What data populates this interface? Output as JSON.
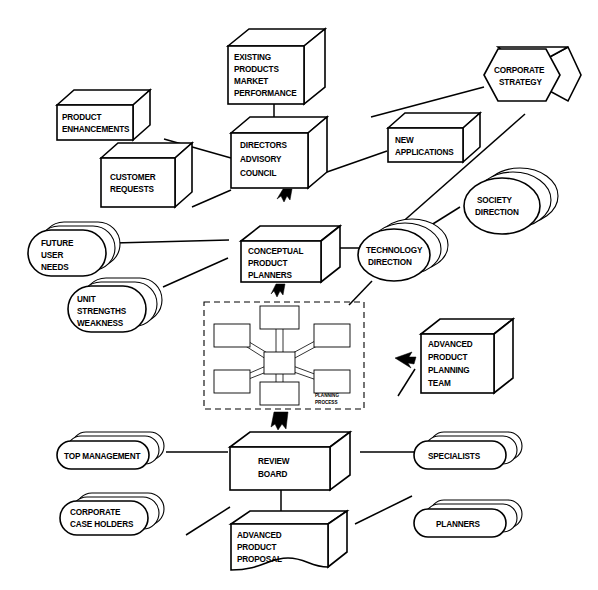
{
  "diagram": {
    "style": {
      "line_color": "#000000",
      "fill_color": "#ffffff",
      "background": "#ffffff"
    },
    "nodes": {
      "existing_products": "EXISTING\nPRODUCTS\nMARKET\nPERFORMANCE",
      "existing_products_lines": [
        "EXISTING",
        "PRODUCTS",
        "MARKET",
        "PERFORMANCE"
      ],
      "product_enhancements_lines": [
        "PRODUCT",
        "ENHANCEMENTS"
      ],
      "customer_requests_lines": [
        "CUSTOMER",
        "REQUESTS"
      ],
      "directors_advisory_council_lines": [
        "DIRECTORS",
        "ADVISORY",
        "COUNCIL"
      ],
      "corporate_strategy_lines": [
        "CORPORATE",
        "STRATEGY"
      ],
      "new_applications_lines": [
        "NEW",
        "APPLICATIONS"
      ],
      "society_direction_lines": [
        "SOCIETY",
        "DIRECTION"
      ],
      "future_user_needs_lines": [
        "FUTURE",
        "USER",
        "NEEDS"
      ],
      "unit_strengths_weakness_lines": [
        "UNIT",
        "STRENGTHS",
        "WEAKNESS"
      ],
      "conceptual_product_planners_lines": [
        "CONCEPTUAL",
        "PRODUCT",
        "PLANNERS"
      ],
      "technology_direction_lines": [
        "TECHNOLOGY",
        "DIRECTION"
      ],
      "planning_process_lines": [
        "PLANNING",
        "PROCESS"
      ],
      "advanced_product_planning_team_lines": [
        "ADVANCED",
        "PRODUCT",
        "PLANNING",
        "TEAM"
      ],
      "top_management_lines": [
        "TOP MANAGEMENT"
      ],
      "corporate_case_holders_lines": [
        "CORPORATE",
        "CASE HOLDERS"
      ],
      "review_board_lines": [
        "REVIEW",
        "BOARD"
      ],
      "specialists_lines": [
        "SPECIALISTS"
      ],
      "planners_lines": [
        "PLANNERS"
      ],
      "advanced_product_proposal_lines": [
        "ADVANCED",
        "PRODUCT",
        "PROPOSAL"
      ]
    },
    "node_list": [
      {
        "id": "existing-products-market-performance",
        "label": "EXISTING PRODUCTS MARKET PERFORMANCE",
        "shape": "3d-box"
      },
      {
        "id": "product-enhancements",
        "label": "PRODUCT ENHANCEMENTS",
        "shape": "3d-box"
      },
      {
        "id": "customer-requests",
        "label": "CUSTOMER REQUESTS",
        "shape": "3d-box"
      },
      {
        "id": "directors-advisory-council",
        "label": "DIRECTORS ADVISORY COUNCIL",
        "shape": "3d-cube"
      },
      {
        "id": "corporate-strategy",
        "label": "CORPORATE STRATEGY",
        "shape": "3d-hexagon"
      },
      {
        "id": "new-applications",
        "label": "NEW APPLICATIONS",
        "shape": "3d-box"
      },
      {
        "id": "society-direction",
        "label": "SOCIETY DIRECTION",
        "shape": "stacked-oval"
      },
      {
        "id": "future-user-needs",
        "label": "FUTURE USER NEEDS",
        "shape": "stacked-oval"
      },
      {
        "id": "unit-strengths-weakness",
        "label": "UNIT STRENGTHS WEAKNESS",
        "shape": "stacked-oval"
      },
      {
        "id": "conceptual-product-planners",
        "label": "CONCEPTUAL PRODUCT PLANNERS",
        "shape": "3d-box"
      },
      {
        "id": "technology-direction",
        "label": "TECHNOLOGY DIRECTION",
        "shape": "stacked-oval"
      },
      {
        "id": "planning-process",
        "label": "PLANNING PROCESS",
        "shape": "dashed-container"
      },
      {
        "id": "advanced-product-planning-team",
        "label": "ADVANCED PRODUCT PLANNING TEAM",
        "shape": "3d-cube"
      },
      {
        "id": "top-management",
        "label": "TOP MANAGEMENT",
        "shape": "stacked-lozenge"
      },
      {
        "id": "corporate-case-holders",
        "label": "CORPORATE CASE HOLDERS",
        "shape": "stacked-lozenge"
      },
      {
        "id": "review-board",
        "label": "REVIEW BOARD",
        "shape": "3d-box"
      },
      {
        "id": "specialists",
        "label": "SPECIALISTS",
        "shape": "stacked-lozenge"
      },
      {
        "id": "planners",
        "label": "PLANNERS",
        "shape": "stacked-lozenge"
      },
      {
        "id": "advanced-product-proposal",
        "label": "ADVANCED PRODUCT PROPOSAL",
        "shape": "3d-document"
      }
    ],
    "connections": [
      {
        "from": "existing-products-market-performance",
        "to": "directors-advisory-council",
        "type": "line"
      },
      {
        "from": "product-enhancements",
        "to": "directors-advisory-council",
        "type": "line"
      },
      {
        "from": "customer-requests",
        "to": "directors-advisory-council",
        "type": "line"
      },
      {
        "from": "corporate-strategy",
        "to": "directors-advisory-council",
        "type": "line"
      },
      {
        "from": "new-applications",
        "to": "directors-advisory-council",
        "type": "line"
      },
      {
        "from": "directors-advisory-council",
        "to": "conceptual-product-planners",
        "type": "arrow-down"
      },
      {
        "from": "society-direction",
        "to": "conceptual-product-planners",
        "type": "line"
      },
      {
        "from": "future-user-needs",
        "to": "conceptual-product-planners",
        "type": "line"
      },
      {
        "from": "unit-strengths-weakness",
        "to": "conceptual-product-planners",
        "type": "line"
      },
      {
        "from": "technology-direction",
        "to": "conceptual-product-planners",
        "type": "line"
      },
      {
        "from": "conceptual-product-planners",
        "to": "planning-process",
        "type": "arrow-down"
      },
      {
        "from": "advanced-product-planning-team",
        "to": "planning-process",
        "type": "arrow-left"
      },
      {
        "from": "planning-process",
        "to": "review-board",
        "type": "arrow-down"
      },
      {
        "from": "top-management",
        "to": "review-board",
        "type": "line"
      },
      {
        "from": "corporate-case-holders",
        "to": "review-board",
        "type": "line"
      },
      {
        "from": "specialists",
        "to": "review-board",
        "type": "line"
      },
      {
        "from": "planners",
        "to": "review-board",
        "type": "line"
      },
      {
        "from": "review-board",
        "to": "advanced-product-proposal",
        "type": "line"
      }
    ],
    "planning_process_hub": {
      "label": "PLANNING PROCESS",
      "spoke_count": 6,
      "center_node": "hub",
      "spokes": [
        "top",
        "upper-left",
        "upper-right",
        "lower-left",
        "lower-right",
        "bottom"
      ]
    }
  }
}
